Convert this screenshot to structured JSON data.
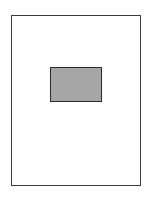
{
  "diagram": {
    "type": "page-layout",
    "page": {
      "shape": "rectangle",
      "stroke": "#3a3a3a",
      "fill": "#ffffff"
    },
    "block": {
      "shape": "rectangle",
      "pattern": "stippled-dots",
      "stroke": "#2a2a2a",
      "dot_color": "#7a7a7a",
      "position": "upper-center"
    }
  }
}
